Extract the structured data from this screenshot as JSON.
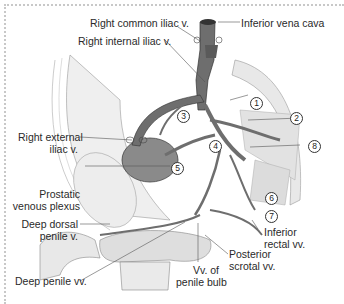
{
  "figure": {
    "colors": {
      "vein": "#6e6e6e",
      "vein_dark": "#4a4a4a",
      "tissue": "#e6e6e6",
      "line": "#555555",
      "border": "#c8c8c8"
    },
    "labels": {
      "right_common_iliac": "Right common iliac v.",
      "inferior_vena_cava": "Inferior vena cava",
      "right_internal_iliac": "Right internal iliac v.",
      "right_external_iliac_1": "Right external",
      "right_external_iliac_2": "iliac v.",
      "prostatic_1": "Prostatic",
      "prostatic_2": "venous plexus",
      "deep_dorsal_1": "Deep dorsal",
      "deep_dorsal_2": "penile v.",
      "deep_penile": "Deep penile vv.",
      "penile_bulb_1": "Vv. of",
      "penile_bulb_2": "penile bulb",
      "posterior_scrotal_1": "Posterior",
      "posterior_scrotal_2": "scrotal vv.",
      "inferior_rectal_1": "Inferior",
      "inferior_rectal_2": "rectal vv."
    },
    "markers": [
      "1",
      "2",
      "3",
      "4",
      "5",
      "6",
      "7",
      "8"
    ]
  }
}
